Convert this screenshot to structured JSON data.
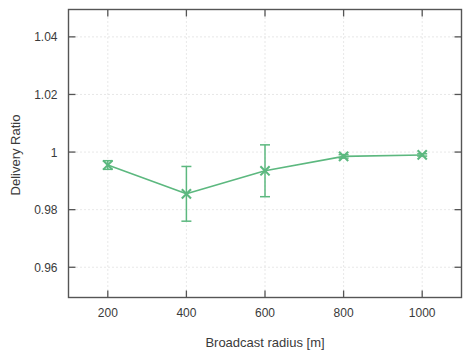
{
  "chart_data": {
    "type": "line",
    "title": "",
    "subtitle": "",
    "xlabel": "Broadcast radius [m]",
    "ylabel": "Delivery Ratio",
    "x": [
      200,
      400,
      600,
      800,
      1000
    ],
    "xticklabels": [
      "200",
      "400",
      "600",
      "800",
      "1000"
    ],
    "yticks": [
      0.96,
      0.98,
      1,
      1.02,
      1.04
    ],
    "yticklabels": [
      "0.96",
      "0.98",
      "1",
      "1.02",
      "1.04"
    ],
    "xlim": [
      100,
      1100
    ],
    "ylim": [
      0.9495,
      1.0495
    ],
    "grid": true,
    "grid_style": "dotted",
    "legend": null,
    "legend_position": "none",
    "marker": "x-cross",
    "errorbars": true,
    "series": [
      {
        "name": "Delivery Ratio",
        "color": "#5cb87f",
        "values": [
          0.9955,
          0.9855,
          0.9935,
          0.9985,
          0.999
        ],
        "yerr": [
          0.0015,
          0.0095,
          0.009,
          0.0006,
          0.0004
        ]
      }
    ],
    "annotations": []
  },
  "style": {
    "axis_color": "#555555",
    "grid_color": "#cccccc",
    "text_color": "#3a3a3a",
    "background": "#ffffff",
    "series_color": "#5cb87f"
  }
}
